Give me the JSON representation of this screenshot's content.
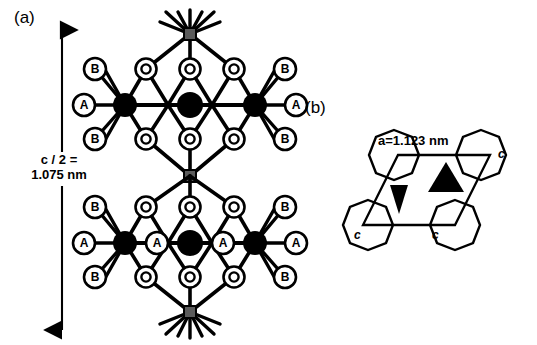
{
  "figure": {
    "type": "crystal-structure-diagram",
    "panels": [
      {
        "id": "a",
        "label": "(a)",
        "description": "side view of hexagonal lattice along c axis",
        "dimension": {
          "name": "c-half",
          "line1": "c / 2 =",
          "line2": "1.075 nm",
          "value": 1.075,
          "unit": "nm",
          "orientation": "vertical",
          "arrow": "double-headed"
        },
        "atom_labels": {
          "A": "A",
          "B": "B",
          "O": "O"
        },
        "upper_unit": {
          "row_top": [
            "B",
            "O",
            "O",
            "O",
            "B"
          ],
          "row_mid": [
            "A",
            "",
            "",
            "",
            "A"
          ],
          "row_bot": [
            "B",
            "O",
            "O",
            "O",
            "B"
          ]
        },
        "lower_unit": {
          "row_top": [
            "B",
            "O",
            "O",
            "O",
            "B"
          ],
          "row_mid": [
            "A",
            "A",
            "",
            "A",
            "A"
          ],
          "row_bot": [
            "B",
            "O",
            "O",
            "O",
            "B"
          ]
        }
      },
      {
        "id": "b",
        "label": "(b)",
        "description": "basal plane projection, rhombic unit cell",
        "dimension": {
          "name": "a-axis",
          "text": "a=1.123 nm",
          "value": 1.123,
          "unit": "nm"
        },
        "corner_labels": [
          "c",
          "c",
          "c"
        ],
        "triangles": [
          "up",
          "down"
        ],
        "polygon_count": 4
      }
    ],
    "colors": {
      "ink": "#000000",
      "paper": "#ffffff",
      "node_grey": "#5a5a5a"
    }
  }
}
